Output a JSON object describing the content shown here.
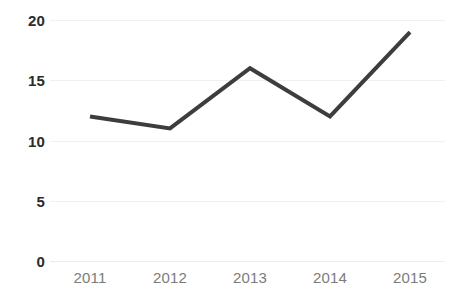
{
  "chart_data": {
    "type": "line",
    "title": "",
    "subtitle": "",
    "xlabel": "",
    "ylabel": "",
    "categories": [
      "2011",
      "2012",
      "2013",
      "2014",
      "2015"
    ],
    "values": [
      12,
      11,
      16,
      12,
      19
    ],
    "series": [
      {
        "name": "",
        "values": [
          12,
          11,
          16,
          12,
          19
        ]
      }
    ],
    "ylim": [
      0,
      20
    ],
    "y_ticks": [
      "0",
      "5",
      "10",
      "15",
      "20"
    ],
    "y_tick_values": [
      0,
      5,
      10,
      15,
      20
    ],
    "x_ticks": [
      "2011",
      "2012",
      "2013",
      "2014",
      "2015"
    ],
    "grid": {
      "horizontal": true,
      "vertical": false,
      "color": "#f0f0f0"
    },
    "legend": {
      "visible": false,
      "position": "none",
      "entries": []
    },
    "annotations": [],
    "markers": false,
    "colors": {
      "background": "#ffffff",
      "line": "#3d3d3d",
      "gridline": "#f0f0f0",
      "y_label_text": "#2b2b2b",
      "x_label_text": "#7b7b7b"
    }
  }
}
